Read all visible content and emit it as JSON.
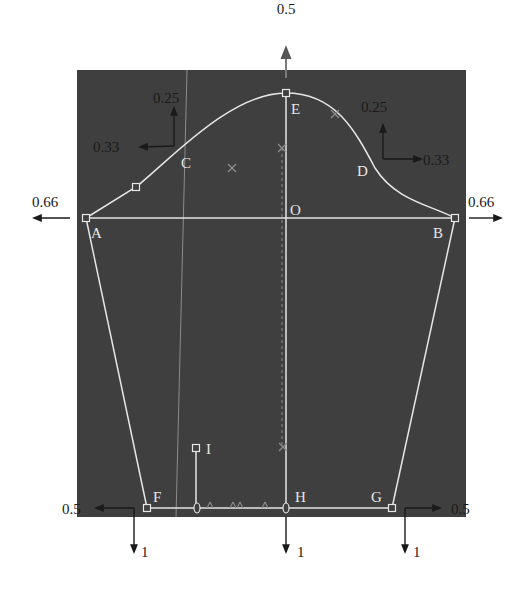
{
  "colors": {
    "background": "#ffffff",
    "panel": "#3f3f3f",
    "pattern_line": "#e6e6e6",
    "guide_line": "#8c8c8c",
    "arrow": "#1a1a1a",
    "label_on_panel": "#ececec",
    "label_outside": "#1a1a1a"
  },
  "panel": {
    "x": 77,
    "y": 70,
    "width": 389,
    "height": 447
  },
  "points": {
    "A": {
      "label": "A",
      "x": 86,
      "y": 218,
      "lx": 91,
      "ly": 238
    },
    "B": {
      "label": "B",
      "x": 455,
      "y": 218,
      "lx": 433,
      "ly": 238
    },
    "E": {
      "label": "E",
      "x": 286,
      "y": 93,
      "lx": 291,
      "ly": 114
    },
    "C": {
      "label": "C",
      "x": 188,
      "y": 163,
      "lx": 181,
      "ly": 168
    },
    "D": {
      "label": "D",
      "x": 368,
      "y": 165,
      "lx": 357,
      "ly": 176
    },
    "O": {
      "label": "O",
      "x": 286,
      "y": 218,
      "lx": 290,
      "ly": 215
    },
    "F": {
      "label": "F",
      "x": 147,
      "y": 508,
      "lx": 153,
      "ly": 502
    },
    "G": {
      "label": "G",
      "x": 392,
      "y": 508,
      "lx": 371,
      "ly": 502
    },
    "H": {
      "label": "H",
      "x": 286,
      "y": 508,
      "lx": 295,
      "ly": 502
    },
    "I": {
      "label": "I",
      "x": 196,
      "y": 448,
      "lx": 206,
      "ly": 454
    }
  },
  "control_markers": [
    {
      "name": "left-curve-marker",
      "x": 136,
      "y": 187
    }
  ],
  "displacement_labels": [
    {
      "name": "top-up",
      "text": "0.5",
      "x": 286,
      "y": 14,
      "anchor": "middle"
    },
    {
      "name": "c-up",
      "text": "0.25",
      "x": 153,
      "y": 103,
      "anchor": "start"
    },
    {
      "name": "c-left",
      "text": "0.33",
      "x": 93,
      "y": 152,
      "anchor": "start"
    },
    {
      "name": "d-up",
      "text": "0.25",
      "x": 361,
      "y": 112,
      "anchor": "start"
    },
    {
      "name": "d-right",
      "text": "0.33",
      "x": 423,
      "y": 165,
      "anchor": "start"
    },
    {
      "name": "a-left",
      "text": "0.66",
      "x": 32,
      "y": 207,
      "anchor": "start"
    },
    {
      "name": "b-right",
      "text": "0.66",
      "x": 468,
      "y": 207,
      "anchor": "start"
    },
    {
      "name": "f-left",
      "text": "0.5",
      "x": 62,
      "y": 514,
      "anchor": "start"
    },
    {
      "name": "g-right",
      "text": "0.5",
      "x": 451,
      "y": 514,
      "anchor": "start"
    },
    {
      "name": "f-down",
      "text": "1",
      "x": 141,
      "y": 557,
      "anchor": "start"
    },
    {
      "name": "h-down",
      "text": "1",
      "x": 297,
      "y": 557,
      "anchor": "start"
    },
    {
      "name": "g-down",
      "text": "1",
      "x": 413,
      "y": 557,
      "anchor": "start"
    }
  ],
  "arrows": [
    {
      "name": "arrow-top-up",
      "x1": 286,
      "y1": 78,
      "x2": 286,
      "y2": 48,
      "color": "#7a7a7a"
    },
    {
      "name": "arrow-c-up",
      "x1": 174,
      "y1": 146,
      "x2": 174,
      "y2": 108
    },
    {
      "name": "arrow-c-left",
      "x1": 174,
      "y1": 146,
      "x2": 140,
      "y2": 147
    },
    {
      "name": "arrow-d-up",
      "x1": 383,
      "y1": 159,
      "x2": 383,
      "y2": 125
    },
    {
      "name": "arrow-d-right",
      "x1": 383,
      "y1": 159,
      "x2": 421,
      "y2": 159
    },
    {
      "name": "arrow-a-left",
      "x1": 70,
      "y1": 218,
      "x2": 34,
      "y2": 218
    },
    {
      "name": "arrow-b-right",
      "x1": 469,
      "y1": 218,
      "x2": 501,
      "y2": 218
    },
    {
      "name": "arrow-f-left",
      "x1": 134,
      "y1": 508,
      "x2": 96,
      "y2": 508
    },
    {
      "name": "arrow-g-right",
      "x1": 405,
      "y1": 508,
      "x2": 440,
      "y2": 508
    },
    {
      "name": "arrow-f-down",
      "x1": 134,
      "y1": 508,
      "x2": 134,
      "y2": 552
    },
    {
      "name": "arrow-h-down",
      "x1": 286,
      "y1": 517,
      "x2": 286,
      "y2": 552
    },
    {
      "name": "arrow-g-down",
      "x1": 405,
      "y1": 508,
      "x2": 405,
      "y2": 552
    }
  ],
  "cross_marks": [
    {
      "x": 282,
      "y": 148
    },
    {
      "x": 283,
      "y": 447
    },
    {
      "x": 232,
      "y": 168
    },
    {
      "x": 335,
      "y": 114
    }
  ],
  "hem_ticks": [
    {
      "x": 210,
      "y": 508
    },
    {
      "x": 233,
      "y": 508
    },
    {
      "x": 240,
      "y": 508
    },
    {
      "x": 265,
      "y": 508
    }
  ],
  "hem_ovals": [
    {
      "x": 197,
      "y": 508
    },
    {
      "x": 286,
      "y": 508
    }
  ]
}
